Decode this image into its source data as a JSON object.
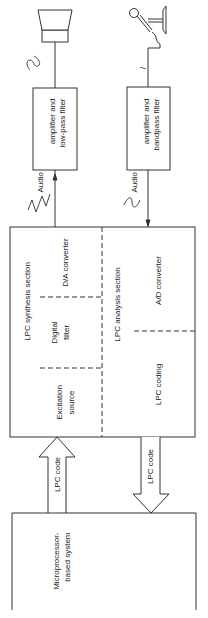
{
  "diagram": {
    "output_chain": {
      "speaker_icon": "speaker-icon",
      "waveform_icon": "sine-wave-icon",
      "filter_box": {
        "line1": "Audio",
        "line2": "amplifier and",
        "line3": "low-pass filter"
      }
    },
    "input_chain": {
      "microphone_icon": "microphone-icon",
      "waveform_icon": "sine-wave-icon",
      "filter_box": {
        "line1": "Audio",
        "line2": "amplifier and",
        "line3": "bandpass filter"
      }
    },
    "lpc_unit": {
      "synthesis": {
        "title": "LPC synthesis section",
        "blocks": [
          {
            "label": "D/A converter"
          },
          {
            "line1": "Digital",
            "line2": "filter"
          },
          {
            "line1": "Excitation",
            "line2": "source"
          }
        ]
      },
      "analysis": {
        "title": "LPC analysis section",
        "blocks": [
          {
            "label": "A/D converter"
          },
          {
            "label": "LPC coding"
          }
        ]
      }
    },
    "links": {
      "to_synthesis": "LPC code",
      "from_analysis": "LPC code"
    },
    "microprocessor": {
      "line1": "Microprocessor-",
      "line2": "based system"
    },
    "colors": {
      "line": "#333333",
      "background": "#ffffff"
    }
  }
}
